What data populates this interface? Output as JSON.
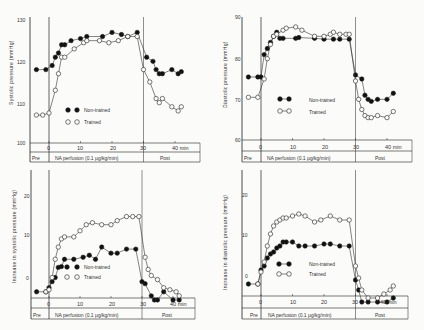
{
  "chart_data": [
    {
      "id": "systolic",
      "type": "line",
      "title": "",
      "xlabel": "min",
      "ylabel": "Systolic pressure (mmHg)",
      "ylim": [
        100,
        130
      ],
      "yticks": [
        "130",
        "120",
        "110",
        "100"
      ],
      "xlim": [
        -5,
        43
      ],
      "xticks": [
        "0",
        "10",
        "20",
        "30",
        "40 min"
      ],
      "phases": [
        "Pre",
        "NA perfusion (0.1 µg/kg/min)",
        "Post"
      ],
      "legend": [
        "Non-trained",
        "Trained"
      ],
      "legend_position": "lower-left inside",
      "grid": false,
      "series": [
        {
          "name": "Non-trained",
          "marker": "filled-circle",
          "x": [
            -4,
            -1,
            1,
            2,
            3,
            4,
            5,
            7,
            10,
            12,
            17,
            20,
            23,
            25,
            28,
            31,
            33,
            34,
            35,
            36,
            39,
            41,
            42
          ],
          "y": [
            118,
            118,
            119,
            121,
            122,
            124,
            124,
            125,
            125.5,
            126,
            126,
            127,
            126.5,
            126,
            127,
            121,
            120,
            118,
            117,
            117,
            118,
            117,
            117.5
          ]
        },
        {
          "name": "Trained",
          "marker": "open-circle",
          "x": [
            -4,
            -2,
            0,
            2,
            3,
            4,
            5,
            8,
            11,
            12,
            16,
            19,
            22,
            25,
            28,
            30,
            32,
            34,
            35,
            36,
            39,
            41,
            42
          ],
          "y": [
            107,
            107,
            107.5,
            113,
            117,
            121,
            121,
            123,
            124.5,
            125,
            125,
            124.5,
            125,
            126,
            126,
            118,
            115,
            111,
            110,
            111,
            109,
            108,
            109
          ]
        }
      ]
    },
    {
      "id": "diastolic",
      "type": "line",
      "title": "",
      "xlabel": "min",
      "ylabel": "Diastolic pressure (mmHg)",
      "ylim": [
        60,
        90
      ],
      "yticks": [
        "90",
        "80",
        "70",
        "60"
      ],
      "xlim": [
        -5,
        43
      ],
      "xticks": [
        "0",
        "10",
        "20",
        "30",
        "40 min"
      ],
      "phases": [
        "Pre",
        "NA perfusion (0.1 µg/kg/min)",
        "Post"
      ],
      "legend": [
        "Non-trained",
        "Trained"
      ],
      "legend_position": "lower-left inside",
      "grid": false,
      "series": [
        {
          "name": "Non-trained",
          "marker": "filled-circle",
          "x": [
            -4,
            -1,
            0,
            1,
            2,
            3,
            4,
            5,
            6,
            7,
            11,
            12,
            17,
            20,
            23,
            25,
            28,
            30,
            32,
            33,
            34,
            35,
            37,
            40,
            42
          ],
          "y": [
            75.5,
            75.5,
            75.5,
            81,
            82.5,
            84,
            85.5,
            86.5,
            85,
            85,
            85,
            85.2,
            85,
            84.8,
            84.8,
            84.8,
            84.8,
            76,
            75,
            71,
            70,
            69.5,
            70,
            70,
            71.5
          ]
        },
        {
          "name": "Trained",
          "marker": "open-circle",
          "x": [
            -4,
            -1,
            1,
            2,
            3,
            4,
            5,
            7,
            8,
            11,
            13,
            17,
            20,
            22,
            23,
            25,
            27,
            28,
            30,
            31,
            32,
            33,
            34,
            35,
            37,
            40,
            42
          ],
          "y": [
            70.5,
            70.5,
            75,
            80,
            83.5,
            85.5,
            86,
            87,
            87.5,
            87.8,
            87,
            85.5,
            85.5,
            86,
            86.5,
            86,
            86,
            86,
            74.5,
            70,
            67.5,
            66,
            65.5,
            65.5,
            66,
            65.5,
            67
          ]
        }
      ]
    },
    {
      "id": "increase-systolic",
      "type": "line",
      "title": "",
      "xlabel": "min",
      "ylabel": "Increase in systolic pressure (mmHg)",
      "ylim": [
        -3,
        27
      ],
      "yticks": [
        "20",
        "10",
        "0"
      ],
      "xlim": [
        -5,
        43
      ],
      "xticks": [
        "0",
        "10",
        "20",
        "30",
        "40 min"
      ],
      "phases": [
        "Pre",
        "NA perfusion (0.1 µg/kg/min)",
        "Post"
      ],
      "legend": [
        "Non-trained",
        "Trained"
      ],
      "legend_position": "lower-left inside",
      "grid": false,
      "series": [
        {
          "name": "Non-trained",
          "marker": "filled-circle",
          "x": [
            -4,
            -1,
            0,
            1,
            2,
            3,
            4,
            5,
            8,
            11,
            13,
            15,
            17,
            20,
            22,
            25,
            28,
            30,
            31,
            33,
            34,
            35,
            37,
            40,
            42
          ],
          "y": [
            0,
            0,
            1,
            2.5,
            3.5,
            6,
            6.2,
            8,
            8,
            8.5,
            9,
            8,
            11,
            9.5,
            9.5,
            10.5,
            10.5,
            2.5,
            2,
            -1,
            -2,
            -2,
            0,
            -2,
            -2
          ]
        },
        {
          "name": "Trained",
          "marker": "open-circle",
          "x": [
            -1,
            0,
            1,
            2,
            3,
            4,
            5,
            8,
            10,
            12,
            14,
            17,
            20,
            22,
            25,
            27,
            29,
            31,
            32,
            33,
            35,
            37,
            39,
            41,
            42
          ],
          "y": [
            0,
            0.5,
            3.5,
            8,
            11,
            13,
            13.5,
            13.5,
            15,
            16.5,
            17,
            16.5,
            16.5,
            17.5,
            18.5,
            18.5,
            18.5,
            8.5,
            5.5,
            4,
            3,
            1,
            0.5,
            0,
            -1
          ]
        }
      ]
    },
    {
      "id": "increase-diastolic",
      "type": "line",
      "title": "",
      "xlabel": "min",
      "ylabel": "Increase in diastolic pressure (mmHg)",
      "ylim": [
        -5,
        25
      ],
      "yticks": [
        "20",
        "10",
        "0"
      ],
      "xlim": [
        -5,
        43
      ],
      "xticks": [
        "0",
        "10",
        "20",
        "30",
        "40 min"
      ],
      "phases": [
        "Pre",
        "NA perfusion (0.1 µg/kg/min)",
        "Post"
      ],
      "legend": [
        "Non-trained",
        "Trained"
      ],
      "legend_position": "lower-left inside",
      "grid": false,
      "series": [
        {
          "name": "Non-trained",
          "marker": "filled-circle",
          "x": [
            -4,
            -1,
            0,
            1,
            2,
            3,
            4,
            5,
            6,
            7,
            8,
            10,
            12,
            14,
            17,
            20,
            22,
            25,
            28,
            30,
            31,
            32,
            34,
            37,
            40,
            42
          ],
          "y": [
            -0.5,
            -0.5,
            3,
            4,
            6,
            7,
            7.5,
            8.5,
            9,
            10,
            10,
            10,
            9,
            9,
            9,
            9.5,
            9.5,
            9,
            9,
            0.5,
            -2,
            -5,
            -5,
            -5,
            -5,
            -4
          ]
        },
        {
          "name": "Trained",
          "marker": "open-circle",
          "x": [
            -1,
            0,
            1,
            2,
            3,
            4,
            5,
            6,
            7,
            8,
            10,
            12,
            14,
            17,
            19,
            22,
            25,
            28,
            30,
            31,
            32,
            34,
            37,
            39,
            41,
            42
          ],
          "y": [
            -0.5,
            2.5,
            5,
            9,
            12,
            14,
            15,
            15.5,
            16,
            16,
            16.5,
            17,
            16.5,
            15,
            15.5,
            16.5,
            15.5,
            15.5,
            4,
            1,
            -2,
            -4,
            -4,
            -3,
            -2,
            -1
          ]
        }
      ]
    }
  ],
  "panels": [
    {
      "ylabel": "Systolic pressure (mmHg)",
      "yticks": [
        "130",
        "120",
        "110",
        "100"
      ]
    },
    {
      "ylabel": "Diastolic pressure (mmHg)",
      "yticks": [
        "90",
        "80",
        "70",
        "60"
      ]
    },
    {
      "ylabel": "Increase in systolic pressure (mmHg)",
      "yticks": [
        "20",
        "10",
        "0"
      ]
    },
    {
      "ylabel": "Increase in diastolic pressure (mmHg)",
      "yticks": [
        "20",
        "10",
        "0"
      ]
    }
  ],
  "axis": {
    "xticks": [
      "0",
      "10",
      "20",
      "30",
      "40 min"
    ],
    "phase_pre": "Pre",
    "phase_na": "NA perfusion (0.1 µg/kg/min)",
    "phase_post": "Post"
  },
  "legend": {
    "non_trained": "Non-trained",
    "trained": "Trained"
  }
}
